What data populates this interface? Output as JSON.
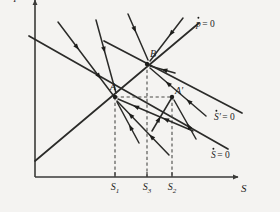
{
  "figure": {
    "background_color": "#f4f3f1",
    "ink_color": "#1d1d1b"
  },
  "axes": {
    "y_label": "p",
    "x_label": "S",
    "origin": {
      "x": 35,
      "y": 177
    },
    "x_axis_end": {
      "x": 238,
      "y": 177
    },
    "y_axis_top": {
      "x": 35,
      "y": 18
    }
  },
  "ticks": [
    {
      "name": "S1",
      "base": "S",
      "sub": "1",
      "x": 115
    },
    {
      "name": "S3",
      "base": "S",
      "sub": "3",
      "x": 147
    },
    {
      "name": "S2",
      "base": "S",
      "sub": "2",
      "x": 172
    }
  ],
  "curves": [
    {
      "id": "p-dot-zero",
      "base": "p",
      "accent": "dot",
      "equals": "= 0",
      "label_x": 196,
      "label_y": 27,
      "from": {
        "x": 35,
        "y": 161
      },
      "to": {
        "x": 199,
        "y": 23
      },
      "slope": "upward"
    },
    {
      "id": "s-prime-dot-zero",
      "base": "S",
      "accent": "dot",
      "prime": "′",
      "equals": "= 0",
      "label_x": 214,
      "label_y": 120,
      "from": {
        "x": 104,
        "y": 41
      },
      "to": {
        "x": 242,
        "y": 113
      },
      "slope": "downward"
    },
    {
      "id": "s-dot-zero",
      "base": "S",
      "accent": "dot",
      "equals": "= 0",
      "label_x": 211,
      "label_y": 158,
      "from": {
        "x": 29,
        "y": 36
      },
      "to": {
        "x": 228,
        "y": 149
      },
      "slope": "downward"
    }
  ],
  "points": [
    {
      "id": "A",
      "label": "A",
      "prime": "",
      "x": 115,
      "y": 97,
      "label_x": 110,
      "label_y": 90
    },
    {
      "id": "B",
      "label": "B",
      "prime": "",
      "x": 147,
      "y": 64,
      "label_x": 150,
      "label_y": 57
    },
    {
      "id": "Ap",
      "label": "A",
      "prime": "′",
      "x": 172,
      "y": 97,
      "label_x": 175,
      "label_y": 94
    }
  ],
  "dashed_guides": [
    {
      "id": "vline-S1",
      "x1": 115,
      "y1": 97,
      "x2": 115,
      "y2": 177
    },
    {
      "id": "vline-S3",
      "x1": 147,
      "y1": 64,
      "x2": 147,
      "y2": 177
    },
    {
      "id": "vline-S2",
      "x1": 172,
      "y1": 97,
      "x2": 172,
      "y2": 177
    },
    {
      "id": "hline-A-Ap",
      "x1": 115,
      "y1": 97,
      "x2": 172,
      "y2": 97
    }
  ],
  "trajectories": [
    {
      "id": "traj-ul-1",
      "x1": 58,
      "y1": 22,
      "x2": 113,
      "y2": 95,
      "arrows": [
        0.38,
        0.78
      ]
    },
    {
      "id": "traj-ul-2",
      "x1": 96,
      "y1": 20,
      "x2": 116,
      "y2": 93,
      "arrows": [
        0.45
      ]
    },
    {
      "id": "traj-ul-3",
      "x1": 128,
      "y1": 14,
      "x2": 148,
      "y2": 60,
      "arrows": [
        0.4
      ]
    },
    {
      "id": "traj-ur-1",
      "x1": 183,
      "y1": 18,
      "x2": 150,
      "y2": 61,
      "arrows": [
        0.42
      ]
    },
    {
      "id": "traj-ur-2",
      "x1": 175,
      "y1": 73,
      "x2": 150,
      "y2": 66,
      "arrows": [
        0.55
      ]
    },
    {
      "id": "traj-lr-1",
      "x1": 206,
      "y1": 116,
      "x2": 150,
      "y2": 68,
      "arrows": [
        0.35,
        0.72
      ]
    },
    {
      "id": "traj-lr-2",
      "x1": 193,
      "y1": 131,
      "x2": 118,
      "y2": 99,
      "arrows": [
        0.4,
        0.8
      ]
    },
    {
      "id": "traj-lr-3",
      "x1": 169,
      "y1": 155,
      "x2": 117,
      "y2": 101,
      "arrows": [
        0.38,
        0.78
      ]
    },
    {
      "id": "traj-lr-4",
      "x1": 139,
      "y1": 143,
      "x2": 117,
      "y2": 102,
      "arrows": [
        0.45
      ]
    },
    {
      "id": "traj-ap-1",
      "x1": 152,
      "y1": 131,
      "x2": 171,
      "y2": 99,
      "arrows": [
        0.45
      ]
    },
    {
      "id": "traj-sp-1",
      "x1": 196,
      "y1": 139,
      "x2": 174,
      "y2": 100,
      "arrows": [
        0.4
      ]
    }
  ]
}
